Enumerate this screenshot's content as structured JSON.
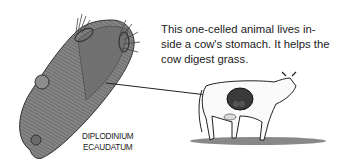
{
  "caption": {
    "lines": [
      "This one-celled animal lives in-",
      "side a cow's stomach. It helps the",
      "cow digest grass."
    ]
  },
  "organism_label": {
    "lines": [
      "DIPLODINIUM",
      "ECAUDATUM"
    ]
  },
  "illustrations": {
    "organism": "one-celled-animal-drawing",
    "cow": "cow-drawing-with-highlighted-stomach"
  },
  "colors": {
    "organism_fill": "#7a7a7a",
    "ink": "#222222",
    "stomach": "#3a3a3a"
  }
}
